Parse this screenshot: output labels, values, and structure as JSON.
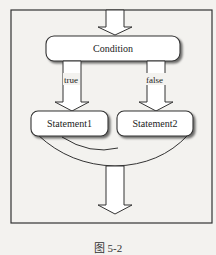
{
  "diagram": {
    "type": "flowchart",
    "nodes": [
      {
        "id": "condition",
        "label": "Condition"
      },
      {
        "id": "stmt1",
        "label": "Statement1"
      },
      {
        "id": "stmt2",
        "label": "Statement2"
      }
    ],
    "edges": [
      {
        "from": "entry",
        "to": "condition",
        "label": ""
      },
      {
        "from": "condition",
        "to": "stmt1",
        "label": "true"
      },
      {
        "from": "condition",
        "to": "stmt2",
        "label": "false"
      },
      {
        "from": "stmt1",
        "to": "exit",
        "label": ""
      },
      {
        "from": "stmt2",
        "to": "exit",
        "label": ""
      }
    ]
  },
  "labels": {
    "condition": "Condition",
    "stmt1": "Statement1",
    "stmt2": "Statement2",
    "true_label": "true",
    "false_label": "false"
  },
  "caption": "图 5-2",
  "colors": {
    "background": "#f3f2ef",
    "stroke": "#333333",
    "fill": "#ffffff"
  }
}
